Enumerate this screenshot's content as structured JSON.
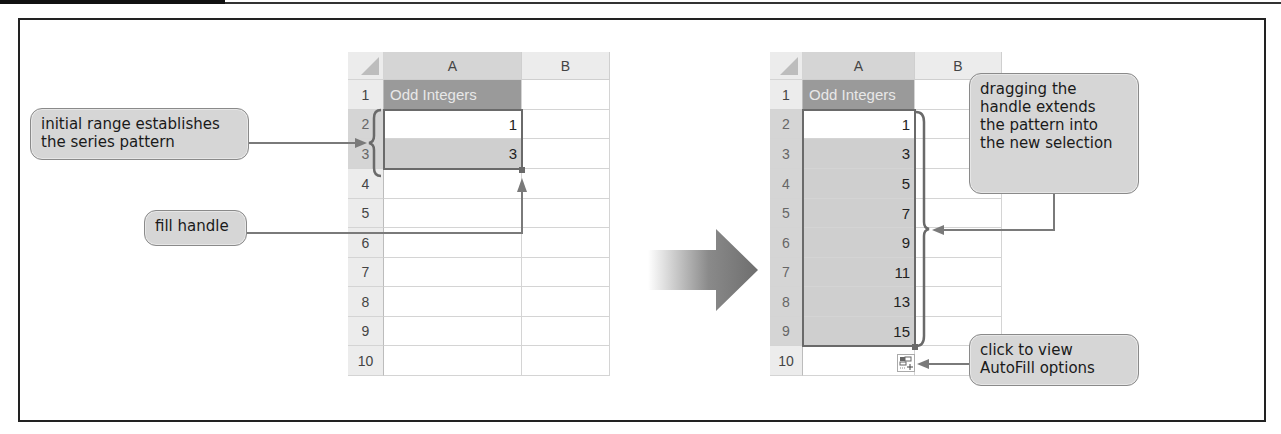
{
  "figure": {
    "left_sheet": {
      "columns": [
        "A",
        "B"
      ],
      "rows": [
        "1",
        "2",
        "3",
        "4",
        "5",
        "6",
        "7",
        "8",
        "9",
        "10"
      ],
      "title_cell": "Odd Integers",
      "values": [
        "1",
        "3"
      ]
    },
    "right_sheet": {
      "columns": [
        "A",
        "B"
      ],
      "rows": [
        "1",
        "2",
        "3",
        "4",
        "5",
        "6",
        "7",
        "8",
        "9",
        "10"
      ],
      "title_cell": "Odd Integers",
      "values": [
        "1",
        "3",
        "5",
        "7",
        "9",
        "11",
        "13",
        "15"
      ]
    },
    "callouts": {
      "initial_range": [
        "initial range establishes",
        "the series pattern"
      ],
      "fill_handle": "fill handle",
      "dragging": [
        "dragging the",
        "handle extends",
        "the pattern into",
        "the new selection"
      ],
      "autofill": [
        "click to view",
        "AutoFill options"
      ]
    },
    "icons": {
      "transition": "right-arrow-icon",
      "autofill_options": "autofill-options-icon"
    }
  }
}
